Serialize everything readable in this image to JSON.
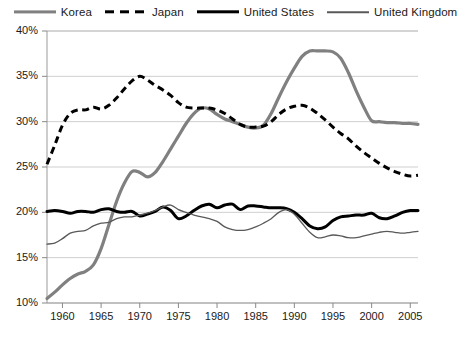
{
  "legend": {
    "position": "top",
    "entries": [
      {
        "label": "Korea",
        "key": "korea",
        "color": "#808080",
        "style": "solid-thick"
      },
      {
        "label": "Japan",
        "key": "japan",
        "color": "#000000",
        "style": "dashed-thick"
      },
      {
        "label": "United States",
        "key": "us",
        "color": "#000000",
        "style": "solid-thick"
      },
      {
        "label": "United Kingdom",
        "key": "uk",
        "color": "#595959",
        "style": "solid-thin"
      }
    ]
  },
  "axes": {
    "y_ticks": [
      "10%",
      "15%",
      "20%",
      "25%",
      "30%",
      "35%",
      "40%"
    ],
    "x_ticks": [
      "1960",
      "1965",
      "1970",
      "1975",
      "1980",
      "1985",
      "1990",
      "1995",
      "2000",
      "2005"
    ]
  },
  "chart_data": {
    "type": "line",
    "title": "",
    "subtitle": "",
    "xlabel": "",
    "ylabel": "",
    "xlim": [
      1958,
      2006
    ],
    "ylim": [
      10,
      40
    ],
    "yunit": "%",
    "ytick_values": [
      10,
      15,
      20,
      25,
      30,
      35,
      40
    ],
    "xtick_values": [
      1960,
      1965,
      1970,
      1975,
      1980,
      1985,
      1990,
      1995,
      2000,
      2005
    ],
    "grid": "horizontal",
    "legend_position": "top",
    "x": [
      1958,
      1959,
      1960,
      1961,
      1962,
      1963,
      1964,
      1965,
      1966,
      1967,
      1968,
      1969,
      1970,
      1971,
      1972,
      1973,
      1974,
      1975,
      1976,
      1977,
      1978,
      1979,
      1980,
      1981,
      1982,
      1983,
      1984,
      1985,
      1986,
      1987,
      1988,
      1989,
      1990,
      1991,
      1992,
      1993,
      1994,
      1995,
      1996,
      1997,
      1998,
      1999,
      2000,
      2001,
      2002,
      2003,
      2004,
      2005,
      2006
    ],
    "series": [
      {
        "name": "Korea",
        "color": "#808080",
        "style": "solid",
        "width": 3.2,
        "values": [
          10.5,
          11.2,
          12.0,
          12.7,
          13.2,
          13.5,
          14.2,
          16.0,
          18.6,
          21.2,
          23.2,
          24.5,
          24.4,
          23.9,
          24.4,
          25.6,
          27.0,
          28.4,
          29.8,
          30.9,
          31.5,
          31.4,
          30.8,
          30.3,
          30.0,
          29.7,
          29.4,
          29.3,
          29.6,
          30.9,
          32.7,
          34.4,
          35.9,
          37.2,
          37.8,
          37.8,
          37.8,
          37.7,
          37.0,
          35.4,
          33.4,
          31.6,
          30.1,
          30.0,
          29.9,
          29.9,
          29.8,
          29.8,
          29.7
        ]
      },
      {
        "name": "Japan",
        "color": "#000000",
        "style": "dashed",
        "width": 3.0,
        "values": [
          25.3,
          27.4,
          29.6,
          30.9,
          31.3,
          31.3,
          31.6,
          31.4,
          31.8,
          32.6,
          33.6,
          34.5,
          35.0,
          34.6,
          34.0,
          33.5,
          32.9,
          32.1,
          31.6,
          31.5,
          31.5,
          31.5,
          31.3,
          30.9,
          30.3,
          29.7,
          29.4,
          29.4,
          29.5,
          30.0,
          30.8,
          31.4,
          31.7,
          31.8,
          31.5,
          30.9,
          30.2,
          29.4,
          28.7,
          28.1,
          27.3,
          26.6,
          26.0,
          25.4,
          24.9,
          24.5,
          24.2,
          24.0,
          24.1
        ]
      },
      {
        "name": "United States",
        "color": "#000000",
        "style": "solid",
        "width": 3.0,
        "values": [
          20.1,
          20.2,
          20.1,
          19.9,
          20.1,
          20.1,
          20.0,
          20.3,
          20.4,
          20.1,
          20.0,
          20.1,
          19.6,
          19.8,
          20.1,
          20.6,
          20.2,
          19.3,
          19.6,
          20.2,
          20.7,
          20.9,
          20.5,
          20.8,
          20.9,
          20.3,
          20.7,
          20.7,
          20.6,
          20.5,
          20.5,
          20.4,
          20.0,
          19.3,
          18.5,
          18.2,
          18.4,
          19.1,
          19.5,
          19.6,
          19.7,
          19.7,
          19.9,
          19.4,
          19.3,
          19.6,
          20.0,
          20.2,
          20.2
        ]
      },
      {
        "name": "United Kingdom",
        "color": "#595959",
        "style": "solid",
        "width": 1.3,
        "values": [
          16.5,
          16.6,
          17.1,
          17.7,
          17.9,
          18.0,
          18.5,
          18.8,
          18.9,
          19.3,
          19.5,
          19.5,
          19.7,
          19.9,
          20.2,
          20.6,
          20.8,
          20.3,
          20.0,
          19.7,
          19.5,
          19.3,
          19.0,
          18.4,
          18.1,
          18.0,
          18.1,
          18.4,
          18.8,
          19.3,
          20.0,
          20.3,
          19.8,
          18.8,
          17.8,
          17.2,
          17.3,
          17.5,
          17.4,
          17.2,
          17.2,
          17.4,
          17.6,
          17.8,
          17.9,
          17.8,
          17.7,
          17.8,
          17.9
        ]
      }
    ]
  }
}
